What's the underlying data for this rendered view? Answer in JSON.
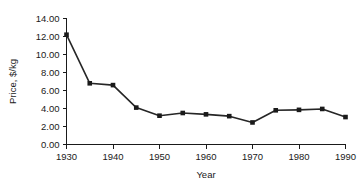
{
  "chart_data": {
    "type": "line",
    "title": "",
    "xlabel": "Year",
    "ylabel": "Price, $/kg",
    "x": [
      1930,
      1935,
      1940,
      1945,
      1950,
      1955,
      1960,
      1965,
      1970,
      1975,
      1980,
      1985,
      1990
    ],
    "values": [
      12.2,
      6.8,
      6.6,
      4.1,
      3.2,
      3.5,
      3.35,
      3.15,
      2.45,
      3.8,
      3.85,
      3.95,
      3.05
    ],
    "series": [
      {
        "name": "Price",
        "values": [
          12.2,
          6.8,
          6.6,
          4.1,
          3.2,
          3.5,
          3.35,
          3.15,
          2.45,
          3.8,
          3.85,
          3.95,
          3.05
        ]
      }
    ],
    "xlim": [
      1930,
      1990
    ],
    "ylim": [
      0,
      14
    ],
    "xtick_labels": [
      "1930",
      "1940",
      "1950",
      "1960",
      "1970",
      "1980",
      "1990"
    ],
    "xticks": [
      1930,
      1940,
      1950,
      1960,
      1970,
      1980,
      1990
    ],
    "ytick_labels": [
      "0.00",
      "2.00",
      "4.00",
      "6.00",
      "8.00",
      "10.00",
      "12.00",
      "14.00"
    ],
    "yticks": [
      0,
      2,
      4,
      6,
      8,
      10,
      12,
      14
    ],
    "grid": false,
    "legend": false,
    "legend_position": "none",
    "marker": "square",
    "line_color": "#262626",
    "marker_color": "#1a1a1a",
    "background_color": "#ffffff"
  }
}
